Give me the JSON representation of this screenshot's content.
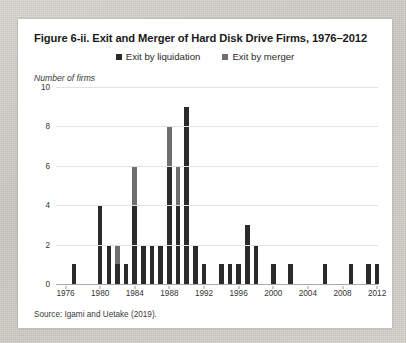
{
  "figure": {
    "title": "Figure 6-ii. Exit and Merger of Hard Disk Drive Firms, 1976–2012",
    "axis_title": "Number of firms",
    "source": "Source: Igami and Uetake (2019)."
  },
  "legend": {
    "items": [
      {
        "label": "Exit by liquidation",
        "color": "#2a2a2a",
        "swatch_name": "legend-swatch-liquidation"
      },
      {
        "label": "Exit by merger",
        "color": "#6f6f6f",
        "swatch_name": "legend-swatch-merger"
      }
    ]
  },
  "chart_data": {
    "type": "bar",
    "stacked": true,
    "title": "Figure 6-ii. Exit and Merger of Hard Disk Drive Firms, 1976–2012",
    "xlabel": "",
    "ylabel": "Number of firms",
    "ylim": [
      0,
      10
    ],
    "ytick_values": [
      0,
      2,
      4,
      6,
      8,
      10
    ],
    "ytick_labels": [
      "0",
      "2",
      "4",
      "6",
      "8",
      "10"
    ],
    "xlim": [
      1975.4,
      2012.6
    ],
    "xtick_values": [
      1976,
      1980,
      1984,
      1988,
      1992,
      1996,
      2000,
      2004,
      2008,
      2012
    ],
    "xtick_labels": [
      "1976",
      "1980",
      "1984",
      "1988",
      "1992",
      "1996",
      "2000",
      "2004",
      "2008",
      "2012"
    ],
    "grid": "horizontal",
    "legend_position": "top-center",
    "categories": [
      1976,
      1977,
      1978,
      1979,
      1980,
      1981,
      1982,
      1983,
      1984,
      1985,
      1986,
      1987,
      1988,
      1989,
      1990,
      1991,
      1992,
      1993,
      1994,
      1995,
      1996,
      1997,
      1998,
      1999,
      2000,
      2001,
      2002,
      2003,
      2004,
      2005,
      2006,
      2007,
      2008,
      2009,
      2010,
      2011,
      2012
    ],
    "series": [
      {
        "name": "Exit by liquidation",
        "color": "#2a2a2a",
        "values": [
          0,
          1,
          0,
          0,
          4,
          2,
          1,
          1,
          4,
          2,
          2,
          2,
          6,
          4,
          9,
          2,
          1,
          0,
          1,
          1,
          1,
          3,
          2,
          0,
          1,
          0,
          1,
          0,
          0,
          0,
          1,
          0,
          0,
          1,
          0,
          1,
          1
        ]
      },
      {
        "name": "Exit by merger",
        "color": "#6f6f6f",
        "values": [
          0,
          0,
          0,
          0,
          0,
          0,
          1,
          0,
          2,
          0,
          0,
          0,
          2,
          2,
          0,
          0,
          0,
          0,
          0,
          0,
          0,
          0,
          0,
          0,
          0,
          0,
          0,
          0,
          0,
          0,
          0,
          0,
          0,
          0,
          0,
          0,
          0
        ]
      }
    ],
    "totals": [
      0,
      1,
      0,
      0,
      4,
      2,
      2,
      1,
      6,
      2,
      2,
      2,
      8,
      6,
      9,
      2,
      1,
      0,
      1,
      1,
      1,
      3,
      2,
      0,
      1,
      0,
      1,
      0,
      0,
      0,
      1,
      0,
      0,
      1,
      0,
      1,
      1
    ],
    "annotations": [
      "Source: Igami and Uetake (2019)."
    ]
  }
}
